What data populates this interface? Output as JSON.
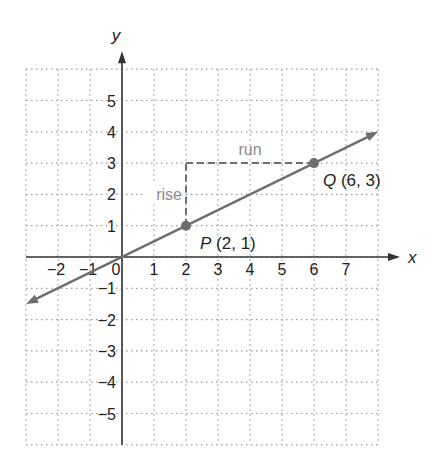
{
  "chart_data": {
    "type": "line",
    "title": "",
    "xlabel": "x",
    "ylabel": "y",
    "xlim": [
      -3,
      8
    ],
    "ylim": [
      -6,
      6
    ],
    "grid": true,
    "x_tick_labels": [
      "−2",
      "−1",
      "0",
      "1",
      "2",
      "3",
      "4",
      "5",
      "6",
      "7"
    ],
    "x_ticks": [
      -2,
      -1,
      0,
      1,
      2,
      3,
      4,
      5,
      6,
      7
    ],
    "y_tick_labels": [
      "5",
      "4",
      "3",
      "2",
      "1",
      "−1",
      "−2",
      "−3",
      "−4",
      "−5"
    ],
    "y_ticks": [
      5,
      4,
      3,
      2,
      1,
      -1,
      -2,
      -3,
      -4,
      -5
    ],
    "series": [
      {
        "name": "line",
        "x": [
          -3,
          0,
          2,
          6,
          8
        ],
        "y": [
          -1.5,
          0,
          1,
          3,
          4
        ],
        "slope": 0.5,
        "intercept": 0
      }
    ],
    "points": [
      {
        "name": "P",
        "x": 2,
        "y": 1,
        "label": "P (2, 1)",
        "letter": "P",
        "coords": "(2, 1)"
      },
      {
        "name": "Q",
        "x": 6,
        "y": 3,
        "label": "Q (6, 3)",
        "letter": "Q",
        "coords": "(6, 3)"
      }
    ],
    "annotations": [
      {
        "text": "rise",
        "kind": "dashed-vertical",
        "from": [
          2,
          1
        ],
        "to": [
          2,
          3
        ]
      },
      {
        "text": "run",
        "kind": "dashed-horizontal",
        "from": [
          2,
          3
        ],
        "to": [
          6,
          3
        ]
      }
    ]
  },
  "colors": {
    "line": "#6e6e6e",
    "axis": "#333333",
    "grid": "#9a9a9a",
    "annotation_text": "#8a8a8a",
    "label_text": "#222222"
  }
}
